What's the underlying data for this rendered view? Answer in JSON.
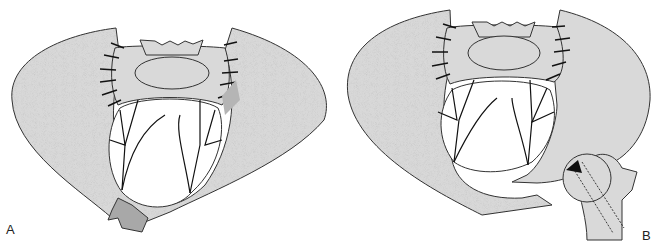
{
  "figure": {
    "panels": [
      {
        "label": "A",
        "description": "Pelvis with sacral plate fixation and fractured anterior ring fragment"
      },
      {
        "label": "B",
        "description": "Pelvis with sacral plate fixation, ring fracture and femoral head with screw trajectory arrow"
      }
    ],
    "colors": {
      "bone": "#d9d9d9",
      "dark_fragment": "#a8a8a8",
      "stroke": "#333333",
      "background": "#ffffff"
    }
  }
}
